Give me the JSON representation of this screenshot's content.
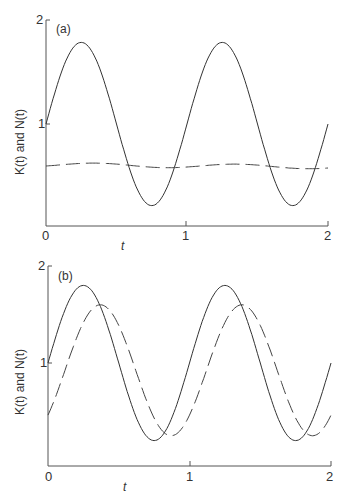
{
  "page_marker": "...",
  "chart_data": [
    {
      "panel": "(a)",
      "type": "line",
      "xlabel": "t",
      "ylabel": "K(t) and N(t)",
      "xlim": [
        0,
        2
      ],
      "ylim": [
        0,
        2
      ],
      "xticks": [
        "0",
        "1",
        "2"
      ],
      "yticks": [
        "0",
        "1",
        "2"
      ],
      "series": [
        {
          "name": "K(t)",
          "style": "solid",
          "x": [
            0,
            0.25,
            0.5,
            0.75,
            1.0,
            1.25,
            1.5,
            1.75,
            2.0
          ],
          "values": [
            1.0,
            1.8,
            1.0,
            0.2,
            1.0,
            1.8,
            1.0,
            0.2,
            1.0
          ]
        },
        {
          "name": "N(t)",
          "style": "dashed",
          "x": [
            0,
            0.25,
            0.5,
            0.75,
            1.0,
            1.25,
            1.5,
            1.75,
            2.0
          ],
          "values": [
            0.6,
            0.61,
            0.63,
            0.6,
            0.58,
            0.6,
            0.62,
            0.6,
            0.57
          ]
        }
      ]
    },
    {
      "panel": "(b)",
      "type": "line",
      "xlabel": "t",
      "ylabel": "K(t) and N(t)",
      "xlim": [
        0,
        2
      ],
      "ylim": [
        0,
        2
      ],
      "xticks": [
        "0",
        "1",
        "2"
      ],
      "yticks": [
        "1",
        "2"
      ],
      "series": [
        {
          "name": "K(t)",
          "style": "solid",
          "x": [
            0,
            0.25,
            0.5,
            0.75,
            1.0,
            1.25,
            1.5,
            1.75,
            2.0
          ],
          "values": [
            1.0,
            1.8,
            1.0,
            0.2,
            1.0,
            1.8,
            1.0,
            0.2,
            1.0
          ]
        },
        {
          "name": "N(t)",
          "style": "dashed",
          "x": [
            0,
            0.12,
            0.37,
            0.62,
            0.87,
            1.12,
            1.37,
            1.62,
            1.87,
            2.0
          ],
          "values": [
            0.5,
            0.92,
            1.6,
            0.92,
            0.25,
            0.92,
            1.6,
            0.92,
            0.25,
            0.5
          ]
        }
      ]
    }
  ]
}
